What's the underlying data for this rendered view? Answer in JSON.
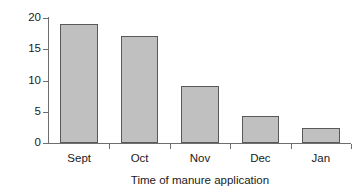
{
  "chart_data": {
    "type": "bar",
    "title": "",
    "subtitle": "",
    "categories": [
      "Sept",
      "Oct",
      "Nov",
      "Dec",
      "Jan"
    ],
    "values": [
      19.0,
      17.1,
      9.2,
      4.3,
      2.4
    ],
    "xlabel": "Time of manure application",
    "ylabel": "Loss as % of total N applied",
    "ylim": [
      0,
      20
    ],
    "yticks": [
      0,
      5,
      10,
      15,
      20
    ],
    "ytick_labels": [
      "0",
      "5",
      "10",
      "15",
      "20"
    ],
    "grid": false,
    "legend": null,
    "bar_fill_color": "#c0c0c0",
    "bar_edge_color": "#59595c",
    "axis_color": "#6e6e6e",
    "background_color": "#ffffff"
  }
}
